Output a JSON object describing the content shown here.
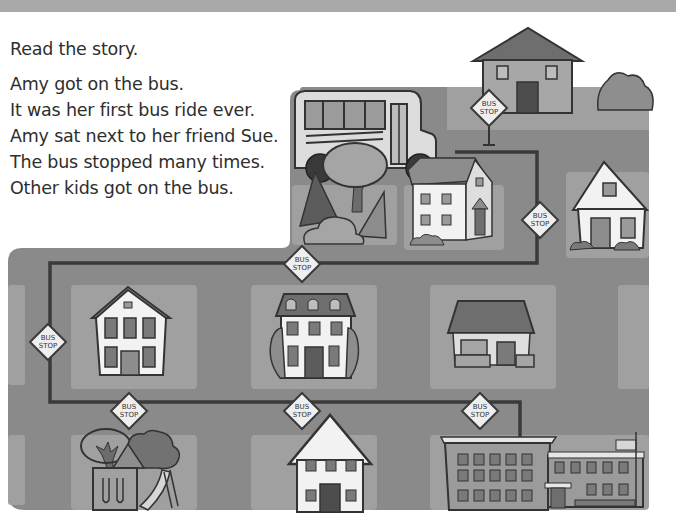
{
  "worksheet": {
    "instruction": "Read the story.",
    "story_lines": [
      "Amy got on the bus.",
      "It was her first bus ride ever.",
      "Amy sat next to her friend Sue.",
      "The bus stopped many times.",
      "Other kids got on the bus."
    ]
  },
  "map": {
    "bus_stop_sign_label_line1": "BUS",
    "bus_stop_sign_label_line2": "STOP",
    "bus_stops": [
      {
        "id": "stop-top-house"
      },
      {
        "id": "stop-right-upper"
      },
      {
        "id": "stop-top-route"
      },
      {
        "id": "stop-left"
      },
      {
        "id": "stop-bottom-left"
      },
      {
        "id": "stop-bottom-middle"
      },
      {
        "id": "stop-bottom-right"
      }
    ],
    "landmarks": [
      "school bus",
      "houses",
      "park with slide",
      "school with flag"
    ],
    "colors": {
      "road": "#8a8a8a",
      "lot": "#a3a3a3",
      "route_line": "#3a3a3a",
      "house_white": "#f2f2f2",
      "sign_fill": "#efefef"
    }
  }
}
